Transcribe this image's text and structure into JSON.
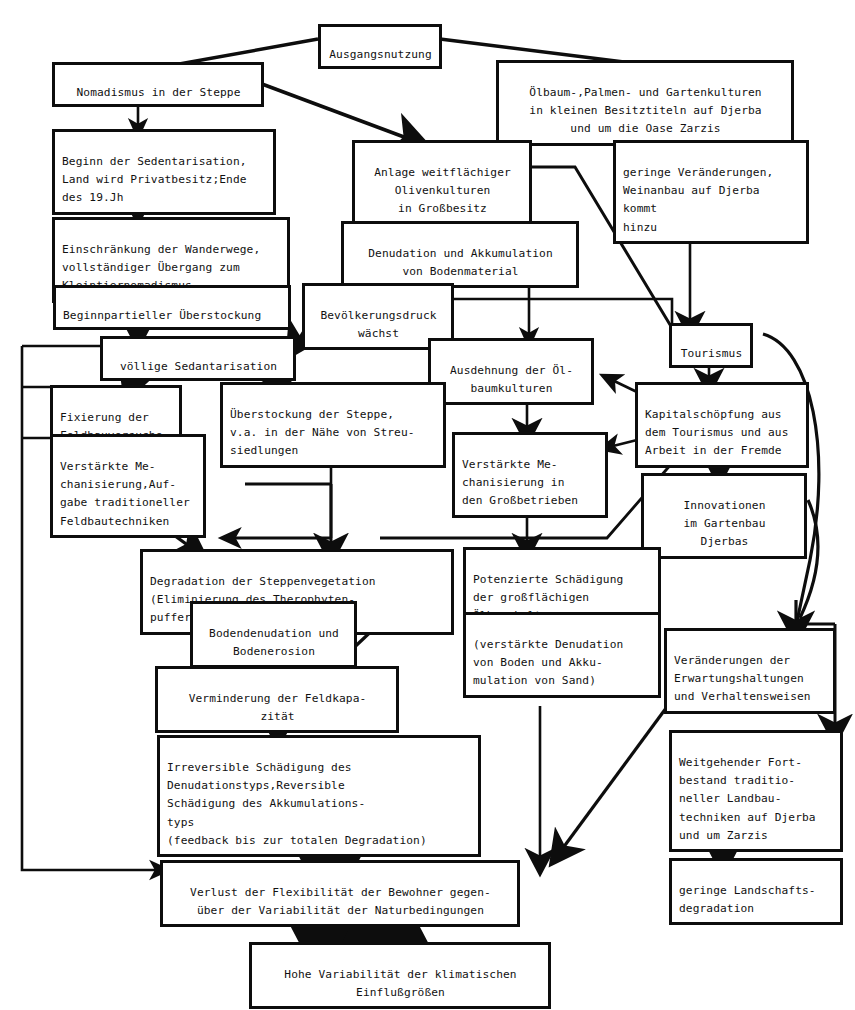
{
  "diagram": {
    "type": "flowchart",
    "line_color": "#0d0d0d",
    "background": "#ffffff"
  },
  "nodes": {
    "ausgangsnutzung": {
      "text": "Ausgangsnutzung"
    },
    "nomadismus": {
      "text": "Nomadismus in der Steppe"
    },
    "oelbaum_palmen": {
      "text": "Ölbaum-,Palmen- und Gartenkulturen\nin kleinen Besitztiteln auf Djerba\nund um die Oase Zarzis"
    },
    "beginn_sedentarisation": {
      "text": "Beginn der Sedentarisation,\nLand wird Privatbesitz;Ende\ndes 19.Jh"
    },
    "anlage_oliven": {
      "text": "Anlage weitflächiger\nOlivenkulturen\nin Großbesitz"
    },
    "geringe_veraenderungen": {
      "text": "geringe Veränderungen,\nWeinanbau auf Djerba kommt\nhinzu"
    },
    "einschraenkung": {
      "text": "Einschränkung der Wanderwege,\nvollständiger Übergang zum\nKleintiernomadismus"
    },
    "denudation_akkumulation": {
      "text": "Denudation und Akkumulation\nvon Bodenmaterial"
    },
    "beginn_partieller": {
      "text": "Beginnpartieller Überstockung"
    },
    "bevoelkerungsdruck": {
      "text": "Bevölkerungsdruck\nwächst"
    },
    "voellige_sedantarisation": {
      "text": "völlige Sedantarisation"
    },
    "tourismus": {
      "text": "Tourismus"
    },
    "ausdehnung_oel": {
      "text": "Ausdehnung der Öl-\nbaumkulturen"
    },
    "fixierung": {
      "text": "Fixierung der\nFeldbauversuche"
    },
    "ueberstockung_steppe": {
      "text": "Überstockung der Steppe,\nv.a. in der Nähe von Streu-\nsiedlungen"
    },
    "kapitalschoepfung": {
      "text": "Kapitalschöpfung aus\ndem Tourismus und aus\nArbeit in der Fremde"
    },
    "verstaerkte_mech_aufgabe": {
      "text": "Verstärkte Me-\nchanisierung,Auf-\ngabe traditioneller\nFeldbautechniken"
    },
    "verstaerkte_mech_gross": {
      "text": "Verstärkte Me-\nchanisierung in\nden Großbetrieben"
    },
    "innovationen": {
      "text": "Innovationen\nim Gartenbau\nDjerbas"
    },
    "degradation_steppenveg": {
      "text": "Degradation der Steppenvegetation\n(Eliminierung des Therophyten-\npuffers)"
    },
    "potenzierte_schaedigung": {
      "text": "Potenzierte Schädigung\nder großflächigen\nÖlbaumkulturen"
    },
    "bodendenudation": {
      "text": "Bodendenudation und\nBodenerosion"
    },
    "verstaerkte_denudation": {
      "text": "(verstärkte Denudation\nvon Boden und Akku-\nmulation von Sand)"
    },
    "veraenderungen_erwartung": {
      "text": "Veränderungen der\nErwartungshaltungen\nund Verhaltensweisen"
    },
    "verminderung_feldkapazitaet": {
      "text": "Verminderung der Feldkapa-\nzität"
    },
    "irreversible_schaedigung": {
      "text": "Irreversible Schädigung des\nDenudationstyps,Reversible\nSchädigung des Akkumulations-\ntyps\n(feedback bis zur totalen Degradation)"
    },
    "weitgehender_fortbestand": {
      "text": "Weitgehender Fort-\nbestand traditio-\nneller Landbau-\ntechniken auf Djerba\nund um Zarzis"
    },
    "verlust_flexibilitaet": {
      "text": "Verlust der Flexibilität der Bewohner gegen-\nüber der Variabilität der Naturbedingungen"
    },
    "geringe_landschaftsdegradation": {
      "text": "geringe Landschafts-\ndegradation"
    },
    "hohe_variabilitaet": {
      "text": "Hohe Variabilität der klimatischen\nEinflußgrößen"
    }
  }
}
